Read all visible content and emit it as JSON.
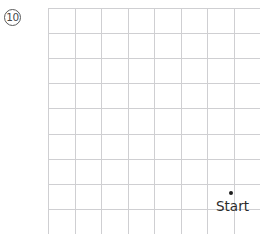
{
  "problem": {
    "number": "10",
    "badge_shape": "circle"
  },
  "grid": {
    "origin_x": 48,
    "origin_y": 8,
    "cell_width": 26.5,
    "cell_height": 25.1,
    "columns": 9,
    "rows": 10,
    "line_color": "#cfcfd2",
    "background_color": "#ffffff"
  },
  "markers": [
    {
      "name": "start-point",
      "label": "Start",
      "dot_x": 231,
      "dot_y": 193,
      "label_x": 216,
      "label_y": 200,
      "dot_color": "#1d1d1d",
      "label_color": "#2b2b2b"
    }
  ],
  "chart_data": {
    "type": "scatter",
    "title": "",
    "xlabel": "",
    "ylabel": "",
    "grid": true,
    "points": [
      {
        "label": "Start",
        "x": 231,
        "y": 193
      }
    ]
  }
}
